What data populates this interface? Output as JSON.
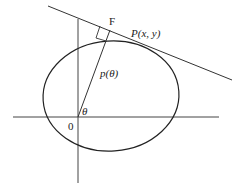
{
  "diagram": {
    "labels": {
      "foot_point": "F",
      "tangent_point": "P(x, y)",
      "support_function": "p(θ)",
      "angle": "θ",
      "origin": "0"
    },
    "colors": {
      "stroke": "#333333",
      "background": "#ffffff"
    }
  }
}
